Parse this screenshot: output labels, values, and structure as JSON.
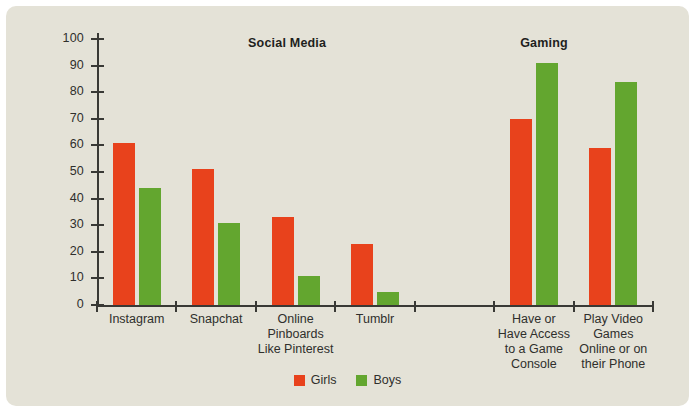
{
  "chart_data": {
    "type": "bar",
    "title": "",
    "xlabel": "",
    "ylabel": "",
    "ylim": [
      0,
      100
    ],
    "ytick_step": 10,
    "grid": false,
    "legend_position": "bottom-center",
    "categories": [
      "Instagram",
      "Snapchat",
      "Online\nPinboards\nLike Pinterest",
      "Tumblr",
      "",
      "Have or\nHave Access\nto a Game\nConsole",
      "Play Video\nGames\nOnline or on\ntheir Phone"
    ],
    "series": [
      {
        "name": "Girls",
        "color": "#e8421c",
        "values": [
          61,
          51,
          33,
          23,
          null,
          70,
          59
        ]
      },
      {
        "name": "Boys",
        "color": "#63a62f",
        "values": [
          44,
          31,
          11,
          5,
          null,
          91,
          84
        ]
      }
    ],
    "sections": [
      {
        "label": "Social Media",
        "center_pct": 34.2
      },
      {
        "label": "Gaming",
        "center_pct": 80.4
      }
    ],
    "ytick_labels": [
      "0",
      "10",
      "20",
      "30",
      "40",
      "50",
      "60",
      "70",
      "80",
      "90",
      "100"
    ]
  },
  "legend": {
    "items": [
      {
        "label": "Girls",
        "color": "#e8421c"
      },
      {
        "label": "Boys",
        "color": "#63a62f"
      }
    ]
  },
  "colors": {
    "card_background": "#e4e2d7",
    "page_background": "#ffffff",
    "axis": "#393935",
    "text": "#2f2f2c",
    "girls": "#e8421c",
    "boys": "#63a62f"
  }
}
